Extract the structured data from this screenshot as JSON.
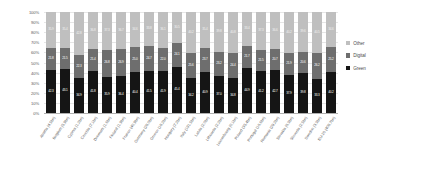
{
  "chart_data": {
    "type": "bar",
    "subtype": "100% stacked column",
    "title": "",
    "xlabel": "",
    "ylabel": "",
    "ylim": [
      0,
      100
    ],
    "ytick_labels": [
      "0%",
      "10%",
      "20%",
      "30%",
      "40%",
      "50%",
      "60%",
      "70%",
      "80%",
      "90%",
      "100%"
    ],
    "ytick_values": [
      0,
      10,
      20,
      30,
      40,
      50,
      60,
      70,
      80,
      90,
      100
    ],
    "grid": true,
    "legend_position": "right",
    "stack_order_bottom_to_top": [
      "Green",
      "Digital",
      "Other"
    ],
    "categories": [
      "Austria (4.5bn)",
      "Belgium (5.9bn)",
      "Cyprus (1.2bn)",
      "Czechia (7.1bn)",
      "Denmark (1.6bn)",
      "Finland (1.9bn)",
      "France (40.9bn)",
      "Germany (28.0bn)",
      "Greece (18.2bn)",
      "Hungary (7.2bn)",
      "Italy (191.5bn)",
      "Latvia (2.0bn)",
      "Lithuania (2.2bn)",
      "Luxembourg (0.1bn)",
      "Poland (35.4bn)",
      "Portugal (16.6bn)",
      "Romania (29.2bn)",
      "Slovakia (6.3bn)",
      "Slovenia (2.5bn)",
      "Sweden (3.3bn)",
      "EU-20 (408.7bn)"
    ],
    "series": [
      {
        "name": "Green",
        "color": "#151515",
        "values": [
          42.3,
          43.1,
          34.9,
          41.8,
          35.9,
          36.4,
          40.4,
          41.5,
          41.9,
          45.4,
          34.2,
          40.9,
          37.0,
          34.8,
          44.9,
          41.2,
          42.7,
          37.9,
          39.8,
          33.3,
          40.2
        ],
        "labels": [
          "42.3",
          "43.1",
          "34.9",
          "41.8",
          "35.9",
          "36.4",
          "40.4",
          "41.5",
          "41.9",
          "45.4",
          "34.2",
          "40.9",
          "37.0",
          "34.8",
          "44.9",
          "41.2",
          "42.7",
          "37.9",
          "39.8",
          "33.3",
          "40.2"
        ]
      },
      {
        "name": "Digital",
        "color": "#6e6e6e",
        "values": [
          21.8,
          21.5,
          22.3,
          21.4,
          26.8,
          26.9,
          25.0,
          24.7,
          22.0,
          24.1,
          25.6,
          23.7,
          23.2,
          24.4,
          21.7,
          21.5,
          20.7,
          21.9,
          20.6,
          26.2,
          25.2
        ],
        "labels": [
          "21.8",
          "21.5",
          "22.3",
          "21.4",
          "26.8",
          "26.9",
          "25.0",
          "24.7",
          "22.0",
          "24.1",
          "25.6",
          "23.7",
          "23.2",
          "24.4",
          "21.7",
          "21.5",
          "20.7",
          "21.9",
          "20.6",
          "26.2",
          "25.2"
        ]
      },
      {
        "name": "Other",
        "color": "#bfbfbf",
        "values": [
          35.9,
          35.4,
          42.8,
          36.8,
          37.3,
          36.7,
          34.6,
          33.8,
          36.1,
          30.5,
          40.2,
          35.4,
          39.8,
          40.8,
          33.4,
          37.3,
          36.6,
          40.2,
          39.6,
          40.5,
          34.6
        ],
        "labels": [
          "35.9",
          "35.4",
          "42.8",
          "36.8",
          "37.3",
          "36.7",
          "34.6",
          "33.8",
          "36.1",
          "30.5",
          "40.2",
          "35.4",
          "39.8",
          "40.8",
          "33.4",
          "37.3",
          "36.6",
          "40.2",
          "39.6",
          "40.5",
          "34.6"
        ]
      }
    ],
    "legend": [
      {
        "label": "Other",
        "color": "#bfbfbf"
      },
      {
        "label": "Digital",
        "color": "#6e6e6e"
      },
      {
        "label": "Green",
        "color": "#151515"
      }
    ],
    "colors": {
      "other": "#bfbfbf",
      "digital": "#6e6e6e",
      "green": "#151515",
      "gridline": "#e6e6e6",
      "axis": "#b0b0b0",
      "text": "#595959",
      "background": "#ffffff"
    }
  }
}
